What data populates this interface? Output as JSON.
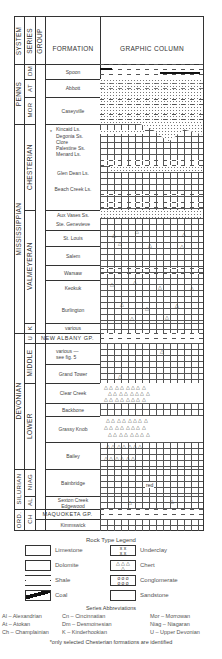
{
  "header": {
    "system": "SYSTEM",
    "series": "SERIES",
    "group": "GROUP",
    "formation": "FORMATION",
    "graphic_column": "GRAPHIC COLUMN"
  },
  "systems": [
    {
      "label": "PENNS",
      "top": 64,
      "bottom": 124
    },
    {
      "label": "MISSISSIPPIAN",
      "top": 124,
      "bottom": 333
    },
    {
      "label": "DEVONIAN",
      "top": 333,
      "bottom": 469
    },
    {
      "label": "SILURIAN",
      "top": 469,
      "bottom": 509
    },
    {
      "label": "ORD.",
      "top": 509,
      "bottom": 530
    }
  ],
  "series": [
    {
      "label": "DM",
      "top": 64,
      "bottom": 79
    },
    {
      "label": "AT",
      "top": 79,
      "bottom": 97
    },
    {
      "label": "MOR",
      "top": 97,
      "bottom": 124
    },
    {
      "label": "CHESTERIAN",
      "top": 124,
      "bottom": 210
    },
    {
      "label": "VALMEYERAN",
      "top": 210,
      "bottom": 323
    },
    {
      "label": "K",
      "top": 323,
      "bottom": 333
    },
    {
      "label": "U",
      "top": 333,
      "bottom": 343
    },
    {
      "label": "MIDDLE",
      "top": 343,
      "bottom": 383
    },
    {
      "label": "LOWER",
      "top": 383,
      "bottom": 469
    },
    {
      "label": "NIAG",
      "top": 469,
      "bottom": 496
    },
    {
      "label": "AL",
      "top": 496,
      "bottom": 509
    },
    {
      "label": "CH",
      "top": 509,
      "bottom": 530
    }
  ],
  "formations": [
    {
      "label": "Spoon",
      "top": 64,
      "bottom": 79
    },
    {
      "label": "Abbott",
      "top": 79,
      "bottom": 97
    },
    {
      "label": "Caseyville",
      "top": 97,
      "bottom": 124
    },
    {
      "label": "Kincaid Ls.",
      "top": 124,
      "bottom": 133,
      "marker": "*"
    },
    {
      "label": "Degonia Ss.",
      "top": 133,
      "bottom": 140
    },
    {
      "label": "Clore",
      "top": 140,
      "bottom": 146
    },
    {
      "label": "Palestine Ss.",
      "top": 146,
      "bottom": 152
    },
    {
      "label": "Menard Ls.",
      "top": 152,
      "bottom": 158
    },
    {
      "label": "Glen Dean Ls.",
      "top": 166,
      "bottom": 180
    },
    {
      "label": "Beach Creek Ls.",
      "top": 182,
      "bottom": 196
    },
    {
      "label": "Aux Vases Ss.",
      "top": 210,
      "bottom": 218
    },
    {
      "label": "Ste. Genevieve",
      "top": 218,
      "bottom": 230
    },
    {
      "label": "St. Louis",
      "top": 230,
      "bottom": 246
    },
    {
      "label": "Salem",
      "top": 246,
      "bottom": 265
    },
    {
      "label": "Warsaw",
      "top": 265,
      "bottom": 280
    },
    {
      "label": "Keokuk",
      "top": 280,
      "bottom": 296
    },
    {
      "label": "Burlington",
      "top": 296,
      "bottom": 323
    },
    {
      "label": "various",
      "top": 323,
      "bottom": 333
    },
    {
      "label": "NEW ALBANY GP.",
      "top": 333,
      "bottom": 343
    },
    {
      "label": "various — see fig. 5",
      "top": 343,
      "bottom": 364
    },
    {
      "label": "Grand Tower",
      "top": 364,
      "bottom": 383
    },
    {
      "label": "Clear Creek",
      "top": 383,
      "bottom": 403
    },
    {
      "label": "Backbone",
      "top": 403,
      "bottom": 416
    },
    {
      "label": "Grassy Knob",
      "top": 416,
      "bottom": 442
    },
    {
      "label": "Bailey",
      "top": 442,
      "bottom": 469
    },
    {
      "label": "Bainbridge",
      "top": 469,
      "bottom": 496
    },
    {
      "label": "Sexton Creek Edgewood",
      "top": 496,
      "bottom": 509
    },
    {
      "label": "MAQUOKETA GP.",
      "top": 509,
      "bottom": 519
    },
    {
      "label": "Kimmswick",
      "top": 519,
      "bottom": 530
    }
  ],
  "legend": {
    "title": "Rock Type Legend",
    "items": [
      {
        "label": "Limestone",
        "icon": "limestone-pattern"
      },
      {
        "label": "Dolomite",
        "icon": "dolomite-pattern"
      },
      {
        "label": "Shale",
        "icon": "shale-pattern"
      },
      {
        "label": "Coal",
        "icon": "coal-pattern"
      },
      {
        "label": "Underclay",
        "icon": "underclay-pattern"
      },
      {
        "label": "Chert",
        "icon": "chert-pattern"
      },
      {
        "label": "Conglomerate",
        "icon": "conglomerate-pattern"
      },
      {
        "label": "Sandstone",
        "icon": "sandstone-pattern"
      }
    ]
  },
  "abbreviations": {
    "title": "Series Abbreviations",
    "items": [
      "Al – Alexandrian",
      "Cn – Cincinnatian",
      "Mor – Morrowan",
      "At – Atokan",
      "Dm – Desmoinesian",
      "Niag – Niagaran",
      "Ch – Champlainian",
      "K – Kinderhookian",
      "U – Upper Devonian"
    ]
  },
  "footnote": "*only selected Chesterian formations are identified",
  "annotations": {
    "red": "red"
  }
}
